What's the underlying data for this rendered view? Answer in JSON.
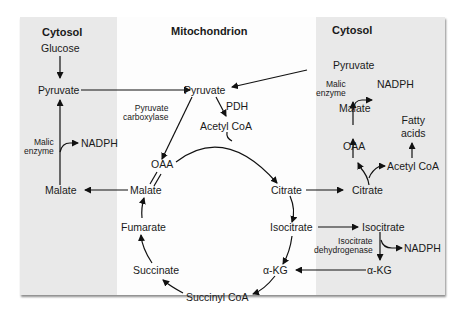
{
  "zones": {
    "left": {
      "title": "Cytosol",
      "color": "#e9e9e9"
    },
    "middle": {
      "title": "Mitochondrion",
      "color": "#fdfdfd"
    },
    "right": {
      "title": "Cytosol",
      "color": "#e9e9e9"
    }
  },
  "left_cytosol": {
    "glucose": "Glucose",
    "pyruvate": "Pyruvate",
    "enzyme": "Malic\nenzyme",
    "nadph": "NADPH",
    "malate": "Malate"
  },
  "mitochondrion": {
    "pyruvate": "Pyruvate",
    "pyruvate_carboxylase": "Pyruvate\ncarboxylase",
    "pdh": "PDH",
    "acetyl_coa": "Acetyl CoA",
    "oaa": "OAA",
    "malate": "Malate",
    "citrate": "Citrate",
    "fumarate": "Fumarate",
    "isocitrate": "Isocitrate",
    "succinate": "Succinate",
    "alpha_kg": "α-KG",
    "succinyl_coa": "Succinyl CoA"
  },
  "right_cytosol": {
    "pyruvate": "Pyruvate",
    "enzyme": "Malic\nenzyme",
    "nadph_top": "NADPH",
    "malate": "Malate",
    "fatty_acids": "Fatty\nacids",
    "oaa": "OAA",
    "acetyl_coa": "Acetyl CoA",
    "citrate": "Citrate",
    "isocitrate": "Isocitrate",
    "idh": "Isocitrate\ndehydrogenase",
    "nadph_bottom": "NADPH",
    "alpha_kg": "α-KG"
  }
}
